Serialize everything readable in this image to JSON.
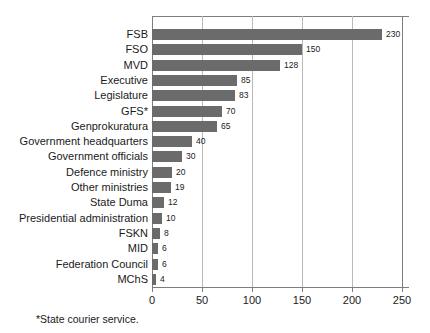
{
  "chart_data": {
    "type": "bar",
    "orientation": "horizontal",
    "title": "",
    "subtitle": "",
    "xlabel": "",
    "ylabel": "",
    "xlim": [
      0,
      257
    ],
    "axis_max_tick": 250,
    "xticks": [
      0,
      50,
      100,
      150,
      200,
      250
    ],
    "xtick_labels": [
      "0",
      "50",
      "100",
      "150",
      "200",
      "250"
    ],
    "grid": "vertical",
    "legend": "none",
    "bar_color": "#6b6b6b",
    "gridline_color": "#b9b9b9",
    "axis_color": "#7d7d7d",
    "background_color": "#ffffff",
    "categories": [
      "FSB",
      "FSO",
      "MVD",
      "Executive",
      "Legislature",
      "GFS*",
      "Genprokuratura",
      "Government headquarters",
      "Government officials",
      "Defence ministry",
      "Other ministries",
      "State Duma",
      "Presidential administration",
      "FSKN",
      "MID",
      "Federation Council",
      "MChS"
    ],
    "values": [
      230,
      150,
      128,
      85,
      83,
      70,
      65,
      40,
      30,
      20,
      19,
      12,
      10,
      8,
      6,
      6,
      4
    ],
    "value_labels": [
      "230",
      "150",
      "128",
      "85",
      "83",
      "70",
      "65",
      "40",
      "30",
      "20",
      "19",
      "12",
      "10",
      "8",
      "6",
      "6",
      "4"
    ],
    "annotations": [
      "*State courier service."
    ]
  },
  "footnote": {
    "text": "*State courier service."
  }
}
